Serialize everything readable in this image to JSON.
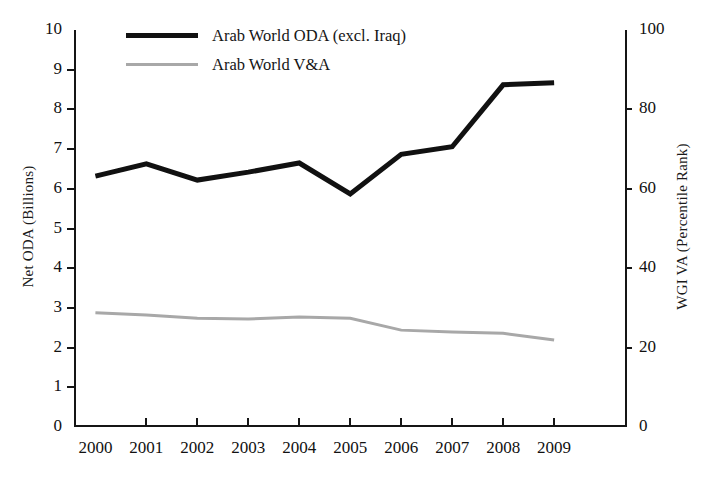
{
  "chart_data": {
    "type": "line",
    "title": "",
    "xlabel": "",
    "categories": [
      "2000",
      "2001",
      "2002",
      "2003",
      "2004",
      "2005",
      "2006",
      "2007",
      "2008",
      "2009"
    ],
    "x": [
      2000,
      2001,
      2002,
      2003,
      2004,
      2005,
      2006,
      2007,
      2008,
      2009
    ],
    "grid": false,
    "legend_position": "top-left",
    "axes": {
      "left": {
        "label": "Net ODA (Billions)",
        "ticks": [
          "10",
          "9",
          "8",
          "7",
          "6",
          "5",
          "4",
          "3",
          "2",
          "1",
          "0"
        ],
        "tick_values": [
          10,
          9,
          8,
          7,
          6,
          5,
          4,
          3,
          2,
          1,
          0
        ],
        "ylim": [
          0,
          10
        ]
      },
      "right": {
        "label": "WGI VA (Percentile Rank)",
        "ticks": [
          "100",
          "80",
          "60",
          "40",
          "20",
          "0"
        ],
        "tick_values": [
          100,
          80,
          60,
          40,
          20,
          0
        ],
        "ylim": [
          0,
          100
        ]
      }
    },
    "series": [
      {
        "name": "Arab World ODA (excl. Iraq)",
        "axis": "left",
        "color": "#111111",
        "width": 5,
        "values": [
          6.32,
          6.63,
          6.22,
          6.42,
          6.65,
          5.87,
          6.87,
          7.06,
          8.62,
          8.67
        ]
      },
      {
        "name": "Arab World V&A",
        "axis": "right",
        "color": "#a8a8a8",
        "width": 3,
        "values": [
          28.8,
          28.2,
          27.4,
          27.2,
          27.7,
          27.4,
          24.4,
          23.9,
          23.6,
          21.9
        ]
      }
    ]
  },
  "legend": {
    "items": [
      {
        "label": "Arab World ODA (excl. Iraq)"
      },
      {
        "label": "Arab World V&A"
      }
    ]
  }
}
